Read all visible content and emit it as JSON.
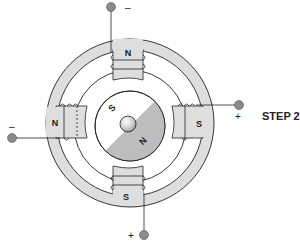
{
  "diagram": {
    "title": "STEP 2",
    "colors": {
      "ring_fill": "#dedede",
      "rotor_north_fill": "#bdbdbd",
      "rotor_south_fill": "#ffffff",
      "terminal_fill": "#8a8a8a",
      "stroke": "#222222"
    },
    "poles": [
      {
        "position": "top",
        "label": "N",
        "terminal_sign": "–"
      },
      {
        "position": "left",
        "label": "N",
        "terminal_sign": "–"
      },
      {
        "position": "right",
        "label": "S",
        "terminal_sign": "+"
      },
      {
        "position": "bottom",
        "label": "S",
        "terminal_sign": "+"
      }
    ],
    "rotor": {
      "south_label": "S",
      "north_label": "N"
    }
  }
}
